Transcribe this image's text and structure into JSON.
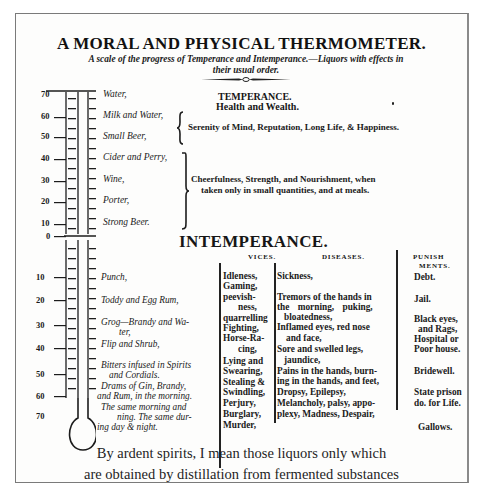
{
  "document": {
    "title": "A MORAL AND PHYSICAL THERMOMETER.",
    "subtitle_line1": "A scale of the progress of Temperance and Intemperance.—Liquors with effects in",
    "subtitle_line2": "their usual order.",
    "ornament": "divider-ornament"
  },
  "temperance": {
    "heading": "TEMPERANCE.",
    "top_effect": "Health and Wealth.",
    "scale": [
      {
        "value": "70",
        "liquor": "Water,"
      },
      {
        "value": "60",
        "liquor": "Milk and Water,"
      },
      {
        "value": "50",
        "liquor": "Small Beer,"
      },
      {
        "value": "40",
        "liquor": "Cider and Perry,"
      },
      {
        "value": "30",
        "liquor": "Wine,"
      },
      {
        "value": "20",
        "liquor": "Porter,"
      },
      {
        "value": "10",
        "liquor": "Strong Beer."
      },
      {
        "value": "0",
        "liquor": ""
      }
    ],
    "effects": [
      {
        "brace_range": "Milk and Water – Small Beer",
        "text": "Serenity of Mind, Reputation, Long Life, & Happiness."
      },
      {
        "brace_range": "Cider and Perry – Strong Beer",
        "line1": "Cheerfulness, Strength, and Nourishment, when",
        "line2": "taken only in small quantities, and at meals."
      }
    ]
  },
  "intemperance": {
    "heading": "INTEMPERANCE.",
    "columns": {
      "vices": "VICES.",
      "diseases": "DISEASES.",
      "punishments_line1": "PUNISH",
      "punishments_line2": "MENTS."
    },
    "scale": [
      {
        "value": "10",
        "liquor": [
          "Punch,"
        ]
      },
      {
        "value": "20",
        "liquor": [
          "Toddy and Egg Rum,"
        ]
      },
      {
        "value": "30",
        "liquor": [
          "Grog—Brandy and Wa-",
          "ter,"
        ]
      },
      {
        "value": "40",
        "liquor": [
          "Flip and Shrub,"
        ]
      },
      {
        "value": "50",
        "liquor": [
          "Bitters infused in Spirits",
          "and Cordials."
        ]
      },
      {
        "value": "60",
        "liquor": [
          "Drams of Gin, Brandy,",
          "and Rum, in the morning."
        ]
      },
      {
        "value": "70",
        "liquor": [
          "The same morning and",
          "ning. The same dur-",
          "ing day & night."
        ]
      }
    ],
    "vices": [
      "Idleness,",
      "Gaming,",
      "peevish-",
      "ness,",
      "quarrelling",
      "Fighting,",
      "Horse-Ra-",
      "cing,",
      "Lying and",
      "Swearing,",
      "Stealing &",
      "Swindling,",
      "Perjury,",
      "Burglary,",
      "Murder,"
    ],
    "diseases": [
      "Sickness,",
      "",
      "Tremors of the hands in",
      "the morning, puking,",
      "bloatedness,",
      "Inflamed eyes, red nose",
      "and face,",
      "Sore and swelled legs,",
      "jaundice,",
      "Pains in the hands, burn-",
      "ing in the hands, and feet,",
      "Dropsy, Epilepsy,",
      "Melancholy, palsy, appo-",
      "plexy, Madness, Despair,"
    ],
    "punishments": [
      "Debt.",
      "",
      "Jail.",
      "",
      "Black eyes,",
      "and Rags,",
      "Hospital or",
      "Poor house.",
      "",
      "Bridewell.",
      "",
      "State prison",
      "do. for Life.",
      "",
      "Gallows."
    ]
  },
  "footer": {
    "line1": "By ardent spirits, I mean those liquors only which",
    "line2": "are obtained by distillation from fermented substances"
  },
  "colors": {
    "ink": "#161616",
    "paper": "#fdfdfc",
    "frame": "#7a7a7a"
  }
}
